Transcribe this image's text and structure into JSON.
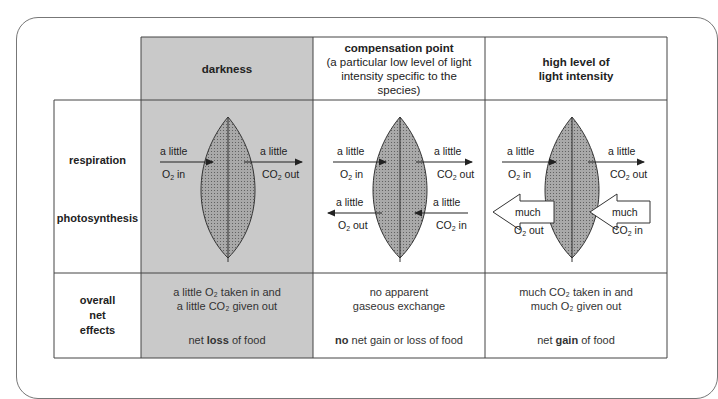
{
  "headers": {
    "darkness": "darkness",
    "compensation_title": "compensation point",
    "compensation_sub": "(a particular low level of light intensity specific to the species)",
    "high_title_1": "high level of",
    "high_title_2": "light intensity"
  },
  "row_labels": {
    "respiration": "respiration",
    "photosynthesis": "photosynthesis",
    "overall_1": "overall",
    "overall_2": "net",
    "overall_3": "effects"
  },
  "arrows": {
    "a_little": "a little",
    "much": "much",
    "o2_in": "O₂ in",
    "co2_out": "CO₂ out",
    "o2_out": "O₂ out",
    "co2_in": "CO₂ in"
  },
  "net_effects": {
    "darkness_line1": "a little O₂ taken in and",
    "darkness_line2": "a little CO₂ given out",
    "darkness_pre": "net ",
    "darkness_bold": "loss",
    "darkness_post": " of food",
    "comp_line1": "no apparent",
    "comp_line2": "gaseous exchange",
    "comp_bold": "no",
    "comp_post": " net gain or loss of food",
    "high_line1": "much CO₂ taken in and",
    "high_line2": "much O₂ given out",
    "high_pre": "net ",
    "high_bold": "gain",
    "high_post": " of food"
  },
  "colors": {
    "darkness_bg": "#c9c9c9",
    "leaf_fill": "#a9a9a9",
    "border": "#555555"
  }
}
